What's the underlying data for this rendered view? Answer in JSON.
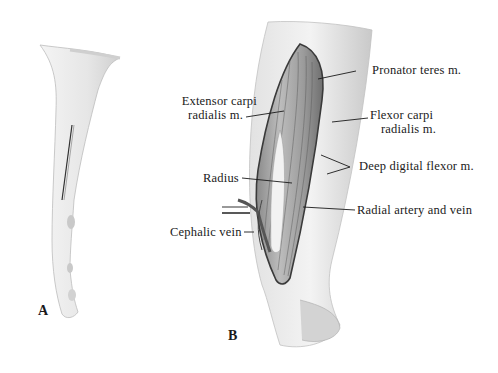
{
  "figure": {
    "panels": [
      {
        "id": "A",
        "label": "A"
      },
      {
        "id": "B",
        "label": "B"
      }
    ],
    "labels": {
      "extensor_line1": "Extensor carpi",
      "extensor_line2": "radialis m.",
      "pronator": "Pronator teres m.",
      "flexor_line1": "Flexor carpi",
      "flexor_line2": "radialis m.",
      "deep_digital": "Deep digital flexor m.",
      "radius": "Radius",
      "radial_artery": "Radial artery and vein",
      "cephalic": "Cephalic vein"
    },
    "colors": {
      "ink": "#1a1a1a",
      "shade_dark": "#6e6e6e",
      "shade_mid": "#a8a8a8",
      "shade_light": "#d9d9d9"
    }
  }
}
